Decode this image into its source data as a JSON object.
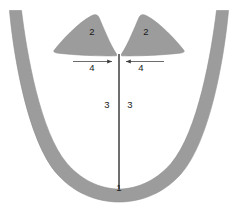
{
  "figure": {
    "background_color": "#ffffff",
    "width": 238,
    "height": 203
  },
  "colors": {
    "structure_fill": "#9c9c9c",
    "structure_stroke": "#8f8f8f",
    "line_color": "#4a4a4a",
    "label_color": "#1a1a1a",
    "background": "#ffffff"
  },
  "labels": {
    "arch_label": "1",
    "left_wing_label": "2",
    "right_wing_label": "2",
    "left_midline_label": "3",
    "right_midline_label": "3",
    "left_measure_label": "4",
    "right_measure_label": "4"
  },
  "parts": [
    {
      "id": "arch",
      "number": "1",
      "name": "outer-u-shaped-arch-band",
      "shaded": true
    },
    {
      "id": "left-wing",
      "number": "2",
      "name": "left-triangular-wing",
      "shaded": true
    },
    {
      "id": "right-wing",
      "number": "2",
      "name": "right-triangular-wing",
      "shaded": true
    },
    {
      "id": "left-midline",
      "number": "3",
      "name": "midline-left-region",
      "shaded": false
    },
    {
      "id": "right-midline",
      "number": "3",
      "name": "midline-right-region",
      "shaded": false
    },
    {
      "id": "left-measure",
      "number": "4",
      "name": "left-horizontal-measurement-arrow",
      "shaded": false
    },
    {
      "id": "right-measure",
      "number": "4",
      "name": "right-horizontal-measurement-arrow",
      "shaded": false
    }
  ]
}
